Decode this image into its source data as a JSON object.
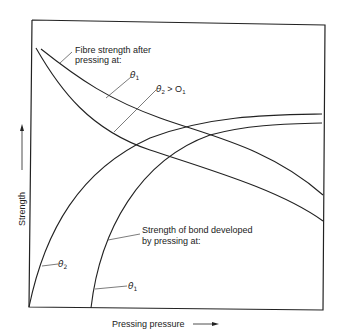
{
  "diagram": {
    "axes": {
      "x_label": "Pressing pressure",
      "y_label": "Strength"
    },
    "labels": {
      "fibre_title_line1": "Fibre strength after",
      "fibre_title_line2": "pressing at:",
      "fibre_theta1": "θ",
      "fibre_theta1_sub": "1",
      "fibre_theta2": "θ",
      "fibre_theta2_sub": "2",
      "fibre_theta2_rel": " > O",
      "fibre_theta2_rel_sub": "1",
      "bond_title_line1": "Strength of bond developed",
      "bond_title_line2": "by pressing at:",
      "bond_theta2": "θ",
      "bond_theta2_sub": "2",
      "bond_theta1": "θ",
      "bond_theta1_sub": "1"
    },
    "curves": [
      {
        "name": "Fibre strength θ1",
        "trend": "decreasing"
      },
      {
        "name": "Fibre strength θ2 > θ1",
        "trend": "decreasing"
      },
      {
        "name": "Bond strength θ2",
        "trend": "increasing, starts at origin"
      },
      {
        "name": "Bond strength θ1",
        "trend": "increasing, starts at higher pressure"
      }
    ],
    "line_color": "#222222"
  }
}
